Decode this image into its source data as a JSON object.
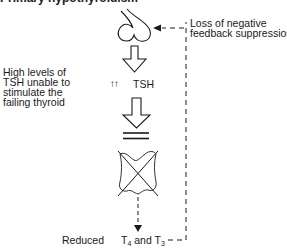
{
  "heading": "Primary hypothyroidism",
  "notes": {
    "feedback_line1": "Loss of negative",
    "feedback_line2": "feedback suppression",
    "left_line1": "High levels of",
    "left_line2": "TSH unable to",
    "left_line3": "stimulate the",
    "left_line4": "failing thyroid"
  },
  "nodes": {
    "pituitary": "pituitary-gland",
    "tsh_prefix": "↑↑",
    "tsh": "TSH",
    "block": "blocked-stimulation",
    "thyroid": "failing-thyroid-crossed"
  },
  "output": {
    "reduced": "Reduced",
    "t4": "T",
    "t4_sub": "4",
    "and": " and T",
    "t3_sub": "3"
  },
  "colors": {
    "stroke": "#1a1a1a",
    "background": "#ffffff"
  }
}
